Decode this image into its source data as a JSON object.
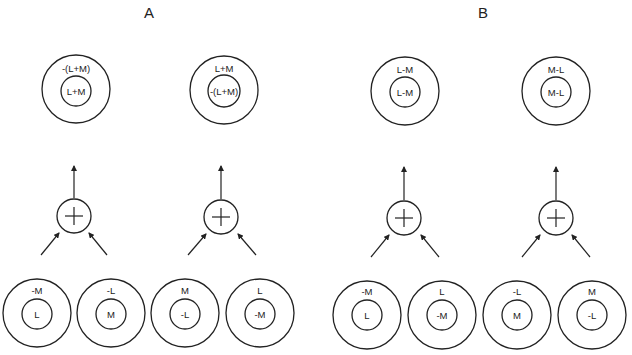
{
  "panels": [
    {
      "label": "A",
      "units": [
        {
          "output": {
            "surround": "-(L+M)",
            "center": "L+M"
          },
          "inputs": [
            {
              "surround": "-M",
              "center": "L"
            },
            {
              "surround": "-L",
              "center": "M"
            }
          ]
        },
        {
          "output": {
            "surround": "L+M",
            "center": "-(L+M)"
          },
          "inputs": [
            {
              "surround": "M",
              "center": "-L"
            },
            {
              "surround": "L",
              "center": "-M"
            }
          ]
        }
      ]
    },
    {
      "label": "B",
      "units": [
        {
          "output": {
            "surround": "L-M",
            "center": "L-M"
          },
          "inputs": [
            {
              "surround": "-M",
              "center": "L"
            },
            {
              "surround": "L",
              "center": "-M"
            }
          ]
        },
        {
          "output": {
            "surround": "M-L",
            "center": "M-L"
          },
          "inputs": [
            {
              "surround": "-L",
              "center": "M"
            },
            {
              "surround": "M",
              "center": "-L"
            }
          ]
        }
      ]
    }
  ],
  "summation_symbol": "+"
}
